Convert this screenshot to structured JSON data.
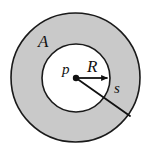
{
  "figure": {
    "type": "geometry-diagram",
    "width": 153,
    "height": 158,
    "background_color": "#ffffff",
    "stroke_color": "#1a1a1a"
  },
  "shapes": {
    "outer_circle": {
      "name": "outer-circle",
      "cx": 75.5,
      "cy": 77.5,
      "r": 64.5,
      "fill": "#c9c9c9",
      "stroke": "#1a1a1a",
      "stroke_width": 1.6
    },
    "inner_circle": {
      "name": "inner-circle",
      "cx": 76,
      "cy": 78,
      "r": 34,
      "fill": "#ffffff",
      "stroke": "#1a1a1a",
      "stroke_width": 1.6
    },
    "center_point": {
      "name": "center-point",
      "cx": 76,
      "cy": 78,
      "r": 3.2,
      "fill": "#111111"
    },
    "radius_arrow": {
      "name": "radius-arrow",
      "x1": 76,
      "y1": 78,
      "x2": 109,
      "y2": 78,
      "stroke": "#111111",
      "stroke_width": 1.8,
      "arrowhead": "filled-triangle"
    },
    "slant_segment": {
      "name": "slant-segment",
      "x1": 76,
      "y1": 78,
      "x2": 130,
      "y2": 116,
      "stroke": "#111111",
      "stroke_width": 1.8
    }
  },
  "labels": {
    "annulus_region": "A",
    "center_point": "p",
    "inner_radius": "R",
    "outer_segment": "s"
  }
}
